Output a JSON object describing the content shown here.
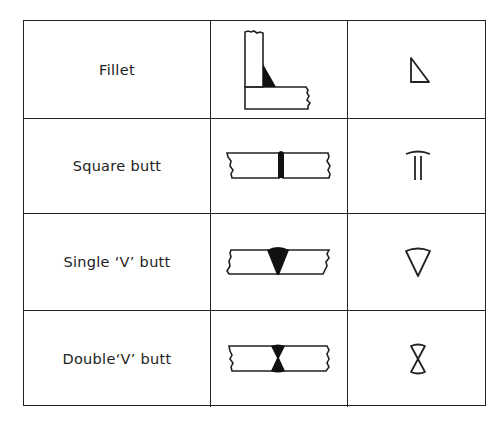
{
  "table": {
    "columns": [
      "Weld type",
      "Cross-section sketch",
      "Symbol"
    ],
    "rows": [
      {
        "label": "Fillet",
        "sketch_icon": "fillet-weld-sketch",
        "symbol_icon": "fillet-symbol-triangle"
      },
      {
        "label": "Square butt",
        "sketch_icon": "square-butt-weld-sketch",
        "symbol_icon": "square-butt-symbol"
      },
      {
        "label": "Single ‘V’ butt",
        "sketch_icon": "single-v-butt-weld-sketch",
        "symbol_icon": "single-v-symbol"
      },
      {
        "label": "Double‘V’ butt",
        "sketch_icon": "double-v-butt-weld-sketch",
        "symbol_icon": "double-v-symbol"
      }
    ]
  },
  "colors": {
    "line": "#222222",
    "background": "#ffffff",
    "weld_fill": "#111111"
  }
}
